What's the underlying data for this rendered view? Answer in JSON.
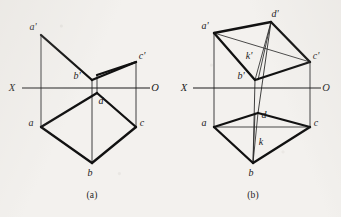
{
  "figure": {
    "type": "orthographic-projection-diagram",
    "background_color": "#f3f1ee",
    "ink_color": "#111111",
    "captions": [
      {
        "id": "a",
        "text": "(a)",
        "x": 92,
        "y": 196
      },
      {
        "id": "b",
        "text": "(b)",
        "x": 253,
        "y": 196
      }
    ]
  },
  "panel_a": {
    "name": "figure-a",
    "axis": {
      "left_label": "X",
      "right_label": "O",
      "left_label_pos": {
        "x": 12,
        "y": 91
      },
      "right_label_pos": {
        "x": 155,
        "y": 91
      },
      "line": {
        "x1": 22,
        "y1": 88,
        "x2": 150,
        "y2": 88
      }
    },
    "vertices": [
      {
        "id": "a-prime",
        "label": "a'",
        "x": 41,
        "y": 35,
        "label_x": 33,
        "label_y": 30
      },
      {
        "id": "b-prime",
        "label": "b'",
        "x": 92,
        "y": 80,
        "label_x": 77,
        "label_y": 79
      },
      {
        "id": "c-prime",
        "label": "c'",
        "x": 136,
        "y": 62,
        "label_x": 140,
        "label_y": 59
      },
      {
        "id": "d",
        "label": "d",
        "x": 97,
        "y": 93,
        "label_x": 101,
        "label_y": 104
      },
      {
        "id": "a",
        "label": "a",
        "x": 41,
        "y": 127,
        "label_x": 31,
        "label_y": 126
      },
      {
        "id": "b",
        "label": "b",
        "x": 92,
        "y": 163,
        "label_x": 89,
        "label_y": 176
      },
      {
        "id": "c",
        "label": "c",
        "x": 136,
        "y": 127,
        "label_x": 140,
        "label_y": 126
      }
    ],
    "heavy_edges": [
      {
        "from": "a-prime",
        "to": "b-prime"
      },
      {
        "from": "b-prime",
        "to": "c-prime"
      },
      {
        "from": "c-prime",
        "to": "d-top"
      },
      {
        "from": "a",
        "to": "b"
      },
      {
        "from": "b",
        "to": "c"
      },
      {
        "from": "a",
        "to": "d"
      },
      {
        "from": "d",
        "to": "c"
      }
    ],
    "thin_edges": [
      {
        "from": "a-prime",
        "to": "a",
        "note": "vertical projector"
      },
      {
        "from": "c-prime",
        "to": "c",
        "note": "vertical projector"
      },
      {
        "from": "b-prime",
        "to": "b",
        "note": "vertical projector"
      },
      {
        "from": "d",
        "to": "d-prime-stub",
        "note": "short vertical stub above d"
      }
    ]
  },
  "panel_b": {
    "name": "figure-b",
    "axis": {
      "left_label": "X",
      "right_label": "O",
      "left_label_pos": {
        "x": 184,
        "y": 91
      },
      "right_label_pos": {
        "x": 326,
        "y": 91
      },
      "line": {
        "x1": 193,
        "y1": 88,
        "x2": 321,
        "y2": 88
      }
    },
    "vertices": [
      {
        "id": "a-prime",
        "label": "a'",
        "x": 214,
        "y": 33,
        "label_x": 204,
        "label_y": 29
      },
      {
        "id": "d-prime",
        "label": "d'",
        "x": 271,
        "y": 22,
        "label_x": 272,
        "label_y": 17
      },
      {
        "id": "c-prime",
        "label": "c'",
        "x": 310,
        "y": 62,
        "label_x": 314,
        "label_y": 59
      },
      {
        "id": "b-prime",
        "label": "b'",
        "x": 255,
        "y": 80,
        "label_x": 240,
        "label_y": 79
      },
      {
        "id": "k-prime",
        "label": "k'",
        "x": 258,
        "y": 60,
        "label_x": 248,
        "label_y": 58
      },
      {
        "id": "d",
        "label": "d",
        "x": 258,
        "y": 113,
        "label_x": 262,
        "label_y": 117
      },
      {
        "id": "k",
        "label": "k",
        "x": 255,
        "y": 139,
        "label_x": 258,
        "label_y": 145
      },
      {
        "id": "a",
        "label": "a",
        "x": 214,
        "y": 127,
        "label_x": 204,
        "label_y": 126
      },
      {
        "id": "c",
        "label": "c",
        "x": 310,
        "y": 127,
        "label_x": 314,
        "label_y": 126
      },
      {
        "id": "b",
        "label": "b",
        "x": 253,
        "y": 163,
        "label_x": 250,
        "label_y": 176
      }
    ],
    "heavy_edges": [
      {
        "from": "a-prime",
        "to": "d-prime"
      },
      {
        "from": "d-prime",
        "to": "c-prime"
      },
      {
        "from": "a-prime",
        "to": "b-prime"
      },
      {
        "from": "b-prime",
        "to": "c-prime"
      },
      {
        "from": "a",
        "to": "d"
      },
      {
        "from": "d",
        "to": "c"
      },
      {
        "from": "a",
        "to": "b"
      },
      {
        "from": "b",
        "to": "c"
      }
    ],
    "thin_edges": [
      {
        "from": "a-prime",
        "to": "c-prime",
        "note": "diagonal"
      },
      {
        "from": "d-prime",
        "to": "b-prime",
        "note": "near-vertical pair"
      },
      {
        "from": "a",
        "to": "c",
        "note": "horizontal diagonal"
      },
      {
        "from": "d",
        "to": "b",
        "note": "near-vertical pair"
      },
      {
        "from": "a-prime",
        "to": "a",
        "note": "vertical projector"
      },
      {
        "from": "c-prime",
        "to": "c",
        "note": "vertical projector"
      },
      {
        "from": "b-prime",
        "to": "b",
        "note": "vertical projector"
      },
      {
        "from": "d-prime",
        "to": "d",
        "note": "vertical projector"
      }
    ]
  }
}
